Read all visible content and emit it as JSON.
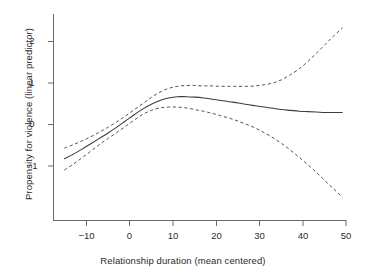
{
  "chart_data": {
    "type": "line",
    "title": "",
    "subtitle": "",
    "xlabel": "Relationship duration (mean centered)",
    "ylabel": "Propensity for violence (linear predictor)",
    "xlim": [
      -15.5,
      50.5
    ],
    "ylim": [
      -1.85,
      2.45
    ],
    "xticks": [
      -10,
      0,
      10,
      20,
      30,
      40,
      50
    ],
    "xtick_labels": [
      "−10",
      "0",
      "10",
      "20",
      "30",
      "40",
      "50"
    ],
    "yticks": [
      -1,
      0,
      1,
      2
    ],
    "ytick_labels": [
      "−1",
      "0",
      "1",
      "2"
    ],
    "grid": false,
    "legend": "none",
    "x": [
      -15,
      -13,
      -11,
      -9,
      -7,
      -5,
      -3,
      -1,
      1,
      3,
      5,
      7,
      9,
      11,
      13,
      15,
      17,
      19,
      21,
      23,
      25,
      27,
      29,
      31,
      33,
      35,
      37,
      39,
      41,
      43,
      45,
      47,
      49
    ],
    "series": [
      {
        "name": "Fitted smooth (linear predictor)",
        "style": "solid",
        "values": [
          -0.83,
          -0.72,
          -0.6,
          -0.47,
          -0.34,
          -0.21,
          -0.07,
          0.08,
          0.23,
          0.37,
          0.49,
          0.58,
          0.64,
          0.67,
          0.67,
          0.66,
          0.64,
          0.61,
          0.58,
          0.55,
          0.52,
          0.48,
          0.45,
          0.42,
          0.39,
          0.36,
          0.34,
          0.32,
          0.31,
          0.3,
          0.29,
          0.29,
          0.29
        ]
      },
      {
        "name": "Upper 95% confidence band",
        "style": "dashed",
        "values": [
          -0.57,
          -0.49,
          -0.4,
          -0.3,
          -0.19,
          -0.07,
          0.06,
          0.2,
          0.35,
          0.5,
          0.65,
          0.78,
          0.87,
          0.92,
          0.94,
          0.94,
          0.93,
          0.93,
          0.92,
          0.92,
          0.92,
          0.92,
          0.93,
          0.96,
          1.0,
          1.08,
          1.2,
          1.34,
          1.52,
          1.72,
          1.93,
          2.14,
          2.33
        ]
      },
      {
        "name": "Lower 95% confidence band",
        "style": "dashed",
        "values": [
          -1.1,
          -0.96,
          -0.81,
          -0.65,
          -0.49,
          -0.34,
          -0.2,
          -0.05,
          0.1,
          0.24,
          0.34,
          0.4,
          0.42,
          0.42,
          0.4,
          0.36,
          0.32,
          0.27,
          0.21,
          0.15,
          0.08,
          0.0,
          -0.09,
          -0.2,
          -0.32,
          -0.46,
          -0.62,
          -0.79,
          -0.97,
          -1.16,
          -1.36,
          -1.56,
          -1.76
        ]
      }
    ],
    "colors": {
      "fit_line": "#3d3d3d",
      "confidence_band": "#555555",
      "axis": "#6b6b6b",
      "text": "#2b2b2b",
      "background": "#ffffff"
    }
  },
  "axes": {
    "x_axis_name": "Relationship duration (mean centered)",
    "y_axis_name": "Propensity for violence (linear predictor)"
  }
}
